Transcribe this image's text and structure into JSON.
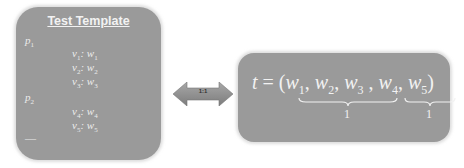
{
  "left_panel": {
    "title": "Test Template",
    "items": [
      {
        "kind": "p",
        "var": "p",
        "sub": "1"
      },
      {
        "kind": "pair",
        "v": "v",
        "vsub": "1",
        "w": "w",
        "wsub": "1"
      },
      {
        "kind": "pair",
        "v": "v",
        "vsub": "2",
        "w": "w",
        "wsub": "2"
      },
      {
        "kind": "pair",
        "v": "v",
        "vsub": "3",
        "w": "w",
        "wsub": "3"
      },
      {
        "kind": "p",
        "var": "p",
        "sub": "2"
      },
      {
        "kind": "pair",
        "v": "v",
        "vsub": "4",
        "w": "w",
        "wsub": "4"
      },
      {
        "kind": "pair",
        "v": "v",
        "vsub": "5",
        "w": "w",
        "wsub": "5"
      },
      {
        "kind": "ellipsis",
        "text": "—"
      }
    ]
  },
  "connector": {
    "label": "1:1",
    "shape": "double-arrow"
  },
  "right_panel": {
    "lhs": "t",
    "eq": "=",
    "open": "(",
    "close": ")",
    "terms": [
      "w",
      "w",
      "w",
      "w",
      "w"
    ],
    "subs": [
      "1",
      "2",
      "3",
      "4",
      "5"
    ],
    "group_labels": [
      "1",
      "1"
    ]
  },
  "colors": {
    "panel": "#9a9a9a",
    "text": "#f2f2f2",
    "arrow": "#8c8c8c"
  }
}
